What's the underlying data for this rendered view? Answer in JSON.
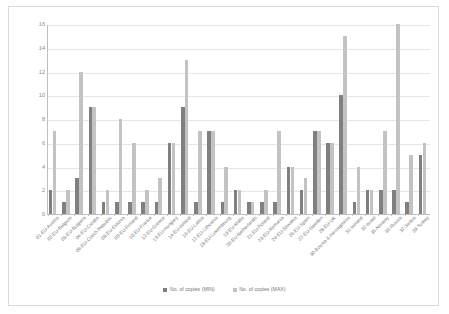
{
  "chart_data": {
    "type": "bar",
    "title": "",
    "subtitle": "",
    "xlabel": "",
    "ylabel": "",
    "ylim": [
      0,
      16
    ],
    "ytick_step": 2,
    "yticks": [
      0,
      2,
      4,
      6,
      8,
      10,
      12,
      14,
      16
    ],
    "grid": true,
    "legend_position": "bottom",
    "categories": [
      "01-EU-Austria",
      "02-EU-Belgium",
      "03-EU-Bulgaria",
      "04-EU-Croatia",
      "06-EU-Czech Republic",
      "08-EU-Estonia",
      "09-EU-Finland",
      "10-EU-France",
      "12-EU-Greece",
      "13-EU-Hungary",
      "14-EU-Ireland",
      "16-EU-Latvia",
      "17-EU-Lithuania",
      "18-EU-Luxembourg",
      "19-EU-Malta",
      "20-EU-Netherlands",
      "21-EU-Poland",
      "23-EU-Romania",
      "24-EU-Slovakia",
      "26-EU-Spain",
      "27-EU-Sweden",
      "28-EU-UK",
      "30-Bosnia & Herzegovina",
      "31-Iceland",
      "32-Israel",
      "35-Norway",
      "36-Russia",
      "37-Serbia",
      "39-Turkey"
    ],
    "series": [
      {
        "name": "No. of copies (MIN)",
        "color": "#808080",
        "values": [
          2,
          1,
          3,
          9,
          1,
          1,
          1,
          1,
          1,
          6,
          9,
          1,
          7,
          1,
          2,
          1,
          1,
          1,
          4,
          2,
          7,
          6,
          10,
          1,
          2,
          2,
          2,
          1,
          5
        ]
      },
      {
        "name": "No. of copies (MAX)",
        "color": "#c3c3c3",
        "values": [
          7,
          2,
          12,
          9,
          2,
          8,
          6,
          2,
          3,
          6,
          13,
          7,
          7,
          4,
          2,
          1,
          2,
          7,
          4,
          3,
          7,
          6,
          15,
          4,
          2,
          7,
          16,
          5,
          6
        ]
      }
    ]
  },
  "legend": {
    "items": [
      {
        "label": "No. of copies (MIN)",
        "color": "#808080"
      },
      {
        "label": "No. of copies (MAX)",
        "color": "#c3c3c3"
      }
    ]
  }
}
